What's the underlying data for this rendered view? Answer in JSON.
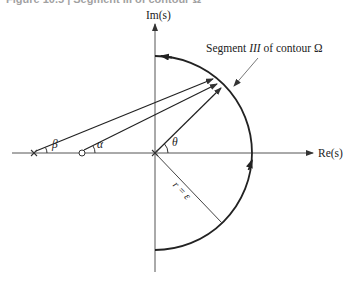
{
  "caption": "Figure 10.5 | Segment III of contour Ω",
  "axes": {
    "imag_label": "Im(s)",
    "real_label": "Re(s)"
  },
  "annotations": {
    "segment_label_pre": "Segment ",
    "segment_label_roman": "III",
    "segment_label_post": " of contour Ω",
    "radius_label": "r = ε",
    "angle_beta": "β",
    "angle_alpha": "α",
    "angle_theta": "θ"
  },
  "markers": {
    "pole_symbol": "×",
    "zero_symbol": "○",
    "origin_symbol": "×"
  },
  "colors": {
    "line": "#333333",
    "axis": "#555555",
    "background": "#ffffff"
  }
}
